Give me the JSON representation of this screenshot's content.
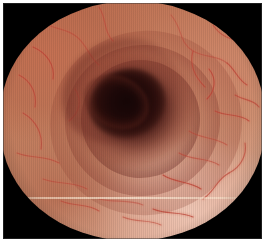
{
  "image": {
    "kind": "endoscopy-photograph",
    "caption": "Endoscopic view of the esophageal lumen with pale pink-salmon mucosa and fine branching submucosal vasculature",
    "modality": "white-light endoscopy",
    "anatomy": "esophagus",
    "view": "axial luminal view",
    "field_of_view_shape": "circular",
    "lumen": {
      "label": "esophageal lumen",
      "center_x_pct": 46,
      "center_y_pct": 45,
      "darkest_color": "#170707"
    },
    "features": [
      {
        "name": "mucosa",
        "label": "esophageal mucosa",
        "color": "#d09878"
      },
      {
        "name": "vascular-pattern",
        "label": "submucosal vascular network",
        "color": "#c4493c"
      },
      {
        "name": "mucosal-folds",
        "label": "concentric mucosal folds",
        "color": "#a8543f"
      },
      {
        "name": "specular-highlight",
        "label": "illumination highlight (lower right)",
        "color": "#f0c8b4"
      },
      {
        "name": "vignette",
        "label": "endoscope field-of-view vignette",
        "color": "#000000"
      },
      {
        "name": "scan-band",
        "label": "horizontal video scan artifact",
        "color": "#ffeed6"
      }
    ],
    "palette": {
      "background_white": "#ffffff",
      "vignette_black": "#000000",
      "mucosa_light": "#eac4ac",
      "mucosa_mid": "#c6805f",
      "mucosa_dark": "#b9694c",
      "vessel_red": "#c0463a",
      "lumen_dark": "#1d0808"
    },
    "vessels": {
      "stroke": "#bf4436",
      "stroke_soft": "#d96b57",
      "paths": [
        "M 168 12 C 180 26, 176 40, 190 48 C 202 55, 214 52, 224 60",
        "M 224 60 C 232 66, 234 76, 244 82",
        "M 190 48 C 186 62, 192 74, 202 84",
        "M 210 22 C 218 34, 230 38, 242 36",
        "M 96 4 C 104 16, 100 28, 110 38",
        "M 38 18 C 52 28, 62 24, 74 34 C 84 42, 86 54, 96 62",
        "M 30 44 C 44 50, 52 62, 50 76",
        "M 16 72 C 28 78, 34 90, 32 104",
        "M 20 110 C 34 118, 40 132, 38 146",
        "M 14 150 C 28 156, 42 152, 56 160",
        "M 40 176 C 56 182, 70 178, 84 186",
        "M 96 196 C 112 200, 126 196, 140 202",
        "M 150 206 C 164 212, 176 208, 190 214",
        "M 200 196 C 212 188, 214 176, 226 170",
        "M 226 170 C 238 164, 244 152, 242 140",
        "M 176 150 C 190 158, 204 154, 216 162",
        "M 186 128 C 198 136, 212 134, 224 142",
        "M 160 172 C 172 180, 186 178, 198 186",
        "M 212 108 C 224 114, 236 110, 246 118",
        "M 232 92 C 242 98, 250 96, 256 104",
        "M 58 198 C 72 204, 84 200, 96 208",
        "M 120 214 C 134 220, 146 216, 158 222",
        "M 72 86 C 80 98, 76 110, 66 118",
        "M 206 66 C 214 76, 212 88, 204 96"
      ]
    }
  }
}
